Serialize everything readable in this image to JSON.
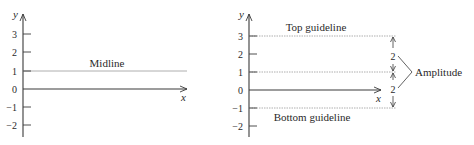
{
  "left_panel": {
    "y_axis_label": "y",
    "x_axis_label": "x",
    "y_ticks": [
      "3",
      "2",
      "1",
      "0",
      "−1",
      "−2"
    ],
    "midline_label": "Midline"
  },
  "right_panel": {
    "y_axis_label": "y",
    "x_axis_label": "x",
    "y_ticks": [
      "3",
      "2",
      "1",
      "0",
      "−1",
      "−2"
    ],
    "top_guideline_label": "Top guideline",
    "bottom_guideline_label": "Bottom guideline",
    "upper_distance": "2",
    "lower_distance": "2",
    "amplitude_label": "Amplitude"
  },
  "colors": {
    "axis": "#3a3a3a",
    "guideline": "#9a9a9a",
    "text": "#2a2a2a"
  }
}
